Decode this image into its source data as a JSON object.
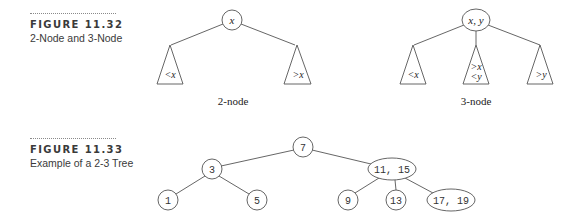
{
  "figures": [
    {
      "label": "FIGURE 11.32",
      "title": "2-Node and 3-Node",
      "two_node": {
        "node_label": "x",
        "subtrees": [
          "<x",
          ">x"
        ],
        "caption": "2-node"
      },
      "three_node": {
        "node_label": "x, y",
        "subtrees": [
          "<x",
          ">x",
          "<y",
          ">y"
        ],
        "caption": "3-node"
      }
    },
    {
      "label": "FIGURE 11.33",
      "title": "Example of a 2-3 Tree",
      "tree": {
        "root": "7",
        "left": "3",
        "right": "11, 15",
        "leaves": [
          "1",
          "5",
          "9",
          "13",
          "17, 19"
        ]
      }
    }
  ],
  "colors": {
    "stroke": "#555555",
    "text": "#222222",
    "caption_text": "#3a3a3a"
  }
}
